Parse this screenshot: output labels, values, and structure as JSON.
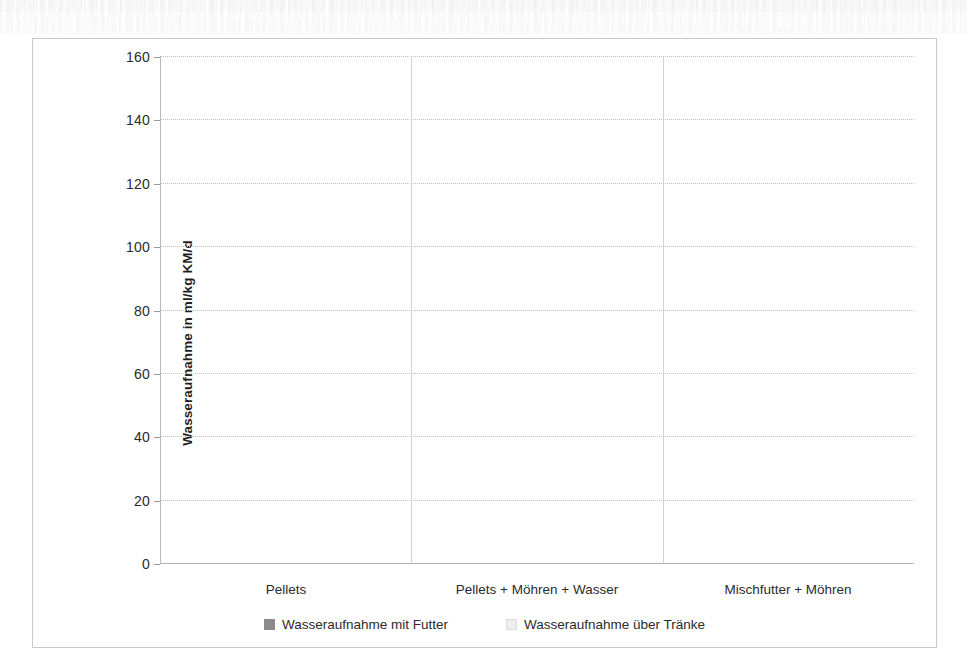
{
  "chart_data": {
    "type": "bar",
    "subtype": "stacked-bar",
    "title": "",
    "xlabel": "",
    "ylabel": "Wasseraufnahme in ml/kg KM/d",
    "ylim": [
      0,
      160
    ],
    "y_ticks": [
      0,
      20,
      40,
      60,
      80,
      100,
      120,
      140,
      160
    ],
    "y_tick_labels": [
      "0",
      "20",
      "40",
      "60",
      "80",
      "100",
      "120",
      "140",
      "160"
    ],
    "grid": true,
    "grid_axis": "y",
    "legend_position": "bottom",
    "categories": [
      "Pellets",
      "Pellets + Möhren + Wasser",
      "Mischfutter + Möhren"
    ],
    "series": [
      {
        "name": "Wasseraufnahme mit Futter",
        "color": "#8b8b8b",
        "values": [
          3,
          146,
          137
        ]
      },
      {
        "name": "Wasseraufnahme über Tränke",
        "color": "#ededed",
        "values": [
          61,
          3.5,
          0
        ]
      }
    ],
    "totals": [
      64,
      149.5,
      137
    ]
  },
  "axis": {
    "y_title": "Wasseraufnahme in ml/kg KM/d",
    "ticks": [
      {
        "value": 160,
        "label": "160"
      },
      {
        "value": 140,
        "label": "140"
      },
      {
        "value": 120,
        "label": "120"
      },
      {
        "value": 100,
        "label": "100"
      },
      {
        "value": 80,
        "label": "80"
      },
      {
        "value": 60,
        "label": "60"
      },
      {
        "value": 40,
        "label": "40"
      },
      {
        "value": 20,
        "label": "20"
      },
      {
        "value": 0,
        "label": "0"
      }
    ]
  },
  "categories": [
    {
      "label": "Pellets"
    },
    {
      "label": "Pellets + Möhren + Wasser"
    },
    {
      "label": "Mischfutter + Möhren"
    }
  ],
  "legend": {
    "items": [
      {
        "label": "Wasseraufnahme mit Futter",
        "swatch": "dark-square-marker"
      },
      {
        "label": "Wasseraufnahme über Tränke",
        "swatch": "light-square-marker"
      }
    ]
  },
  "colors": {
    "series_dark": "#8b8b8b",
    "series_light": "#ededed",
    "gridline": "#c0c0c0",
    "frame": "#c9c9c9",
    "text": "#2b2b2b"
  }
}
